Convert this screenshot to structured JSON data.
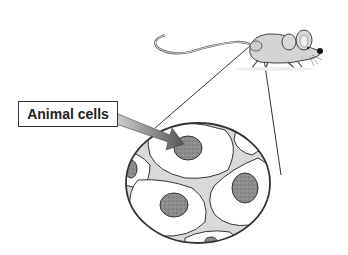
{
  "diagram": {
    "label": "Animal cells",
    "colors": {
      "outline": "#333333",
      "cell_fill": "#ffffff",
      "intercellular_fill": "#d9d9d9",
      "nucleus_fill": "#8a8a8a",
      "arrow_fill": "#7a7a7a",
      "mouse_fill": "#d4d4d4"
    }
  }
}
